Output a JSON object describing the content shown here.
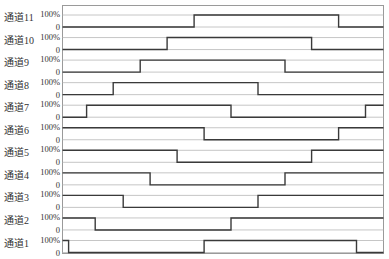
{
  "chart_data": {
    "type": "timing-diagram",
    "title": "",
    "xlabel": "",
    "ylabel": "",
    "x_range": [
      0,
      100
    ],
    "level_labels": {
      "high": "100%",
      "low": "0"
    },
    "colors": {
      "wave": "#3a3a3a",
      "grid": "#b8b8b8",
      "frame": "#9a9a9a",
      "text": "#333333"
    },
    "channels": [
      {
        "name": "通道11",
        "initial": 0,
        "transitions": [
          41.0,
          86.0
        ]
      },
      {
        "name": "通道10",
        "initial": 0,
        "transitions": [
          32.6,
          77.6
        ]
      },
      {
        "name": "通道9",
        "initial": 0,
        "transitions": [
          24.2,
          69.3
        ]
      },
      {
        "name": "通道8",
        "initial": 0,
        "transitions": [
          15.8,
          60.9
        ]
      },
      {
        "name": "通道7",
        "initial": 0,
        "transitions": [
          7.5,
          52.5,
          94.4
        ]
      },
      {
        "name": "通道6",
        "initial": 1,
        "transitions": [
          44.1,
          86.0
        ]
      },
      {
        "name": "通道5",
        "initial": 1,
        "transitions": [
          35.7,
          77.6
        ]
      },
      {
        "name": "通道4",
        "initial": 1,
        "transitions": [
          27.3,
          69.3
        ]
      },
      {
        "name": "通道3",
        "initial": 1,
        "transitions": [
          18.9,
          60.9
        ]
      },
      {
        "name": "通道2",
        "initial": 1,
        "transitions": [
          10.2,
          52.5
        ]
      },
      {
        "name": "通道1",
        "initial": 1,
        "transitions": [
          1.9,
          44.1,
          91.6
        ]
      }
    ]
  }
}
